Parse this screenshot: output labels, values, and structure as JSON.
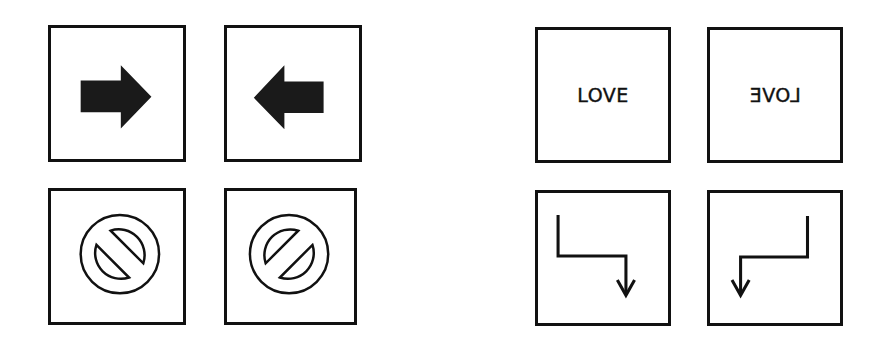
{
  "figure": {
    "groups": [
      {
        "name": "symbols",
        "panels": [
          {
            "id": "arrow-right",
            "icon": "arrow-right-icon",
            "description": "solid black block arrow pointing right"
          },
          {
            "id": "arrow-left",
            "icon": "arrow-left-icon",
            "description": "solid black block arrow pointing left"
          },
          {
            "id": "prohibition-backslash",
            "icon": "prohibition-icon",
            "description": "outlined prohibition sign with bar from upper-left to lower-right"
          },
          {
            "id": "prohibition-slash",
            "icon": "prohibition-icon",
            "description": "outlined prohibition sign with bar from lower-left to upper-right"
          }
        ]
      },
      {
        "name": "text-and-paths",
        "panels": [
          {
            "id": "love",
            "text": "LOVE",
            "mirrored": false
          },
          {
            "id": "love-mirrored",
            "text": "LOVE",
            "mirrored": true
          },
          {
            "id": "fold-arrow-right",
            "icon": "stepped-arrow-down-right-icon",
            "description": "line going down, right, then down with arrowhead"
          },
          {
            "id": "fold-arrow-left",
            "icon": "stepped-arrow-down-left-icon",
            "description": "line going down, left, then down with arrowhead"
          }
        ]
      }
    ],
    "colors": {
      "stroke": "#111111",
      "fill": "#1a1a1a",
      "background": "#ffffff"
    }
  }
}
